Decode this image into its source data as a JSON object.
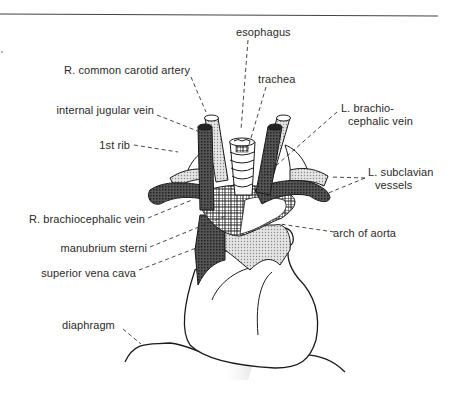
{
  "diagram": {
    "labels": {
      "esophagus": "esophagus",
      "trachea": "trachea",
      "r_common_carotid_artery": "R. common carotid artery",
      "internal_jugular_vein": "internal jugular vein",
      "first_rib": "1st rib",
      "l_brachiocephalic_vein_line1": "L. brachio-",
      "l_brachiocephalic_vein_line2": "cephalic vein",
      "l_subclavian_vessels_line1": "L. subclavian",
      "l_subclavian_vessels_line2": "vessels",
      "r_brachiocephalic_vein": "R. brachiocephalic vein",
      "arch_of_aorta": "arch of aorta",
      "manubrium_sterni": "manubrium sterni",
      "superior_vena_cava": "superior vena cava",
      "diaphragm": "diaphragm"
    },
    "colors": {
      "line": "#1a1a1a",
      "vein_fill": "#3a3a3a",
      "artery_fill": "#bdbdbd",
      "aorta_fill": "#d0d0d0",
      "background": "#ffffff"
    }
  }
}
